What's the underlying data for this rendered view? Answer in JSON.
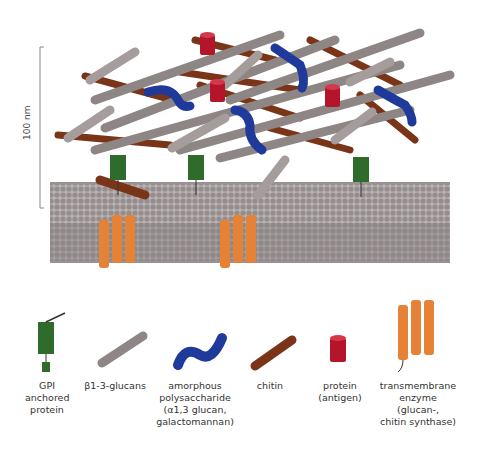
{
  "figure": {
    "scale_bar": {
      "label": "100 nm"
    },
    "colors": {
      "glucan": "#8e8585",
      "glucan_light": "#a59c9c",
      "chitin": "#7a3418",
      "amorphous": "#1f3a9a",
      "protein": "#b5152b",
      "gpi": "#2f6b2a",
      "enzyme": "#e58235",
      "membrane": "#9a9292"
    },
    "legend": [
      {
        "id": "gpi",
        "label": "GPI\nanchored\nprotein"
      },
      {
        "id": "glucan",
        "label": "β1-3-glucans"
      },
      {
        "id": "amorphous",
        "label": "amorphous\npolysaccharide\n(α1,3 glucan,\ngalactomannan)"
      },
      {
        "id": "chitin",
        "label": "chitin"
      },
      {
        "id": "protein",
        "label": "protein\n(antigen)"
      },
      {
        "id": "enzyme",
        "label": "transmembrane\nenzyme\n(glucan-,\nchitin synthase)"
      }
    ]
  }
}
